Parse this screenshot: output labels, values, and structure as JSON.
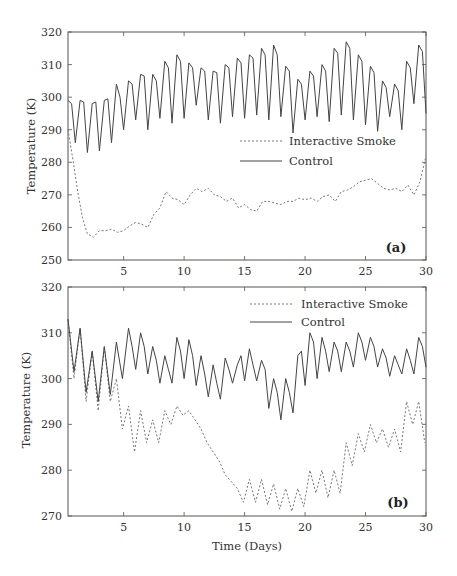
{
  "chart_data": [
    {
      "type": "line",
      "panel_label": "(a)",
      "title": "",
      "xlabel": "",
      "ylabel": "Temperature (K)",
      "xlim": [
        0.4,
        30
      ],
      "ylim": [
        250,
        320
      ],
      "x_ticks": [
        5,
        10,
        15,
        20,
        25,
        30
      ],
      "y_ticks": [
        250,
        260,
        270,
        280,
        290,
        300,
        310,
        320
      ],
      "grid": false,
      "legend": {
        "position": "center-right",
        "entries": [
          "Interactive Smoke",
          "Control"
        ]
      },
      "series": [
        {
          "name": "Interactive Smoke",
          "style": "dashed",
          "x": [
            0.4,
            0.8,
            1.2,
            1.6,
            2.0,
            2.5,
            3.0,
            3.5,
            4.0,
            4.5,
            5.0,
            5.5,
            6.0,
            6.5,
            7.0,
            7.5,
            8.0,
            8.5,
            9.0,
            9.5,
            10.0,
            10.5,
            11.0,
            11.5,
            12.0,
            12.5,
            13.0,
            13.5,
            14.0,
            14.5,
            15.0,
            15.5,
            16.0,
            16.5,
            17.0,
            17.5,
            18.0,
            18.5,
            19.0,
            19.5,
            20.0,
            20.5,
            21.0,
            21.5,
            22.0,
            22.5,
            23.0,
            23.5,
            24.0,
            24.5,
            25.0,
            25.5,
            26.0,
            26.5,
            27.0,
            27.5,
            28.0,
            28.5,
            29.0,
            29.5,
            30.0
          ],
          "values": [
            290,
            281,
            271,
            263,
            258,
            257,
            259,
            259,
            259.5,
            258.5,
            259,
            260.5,
            261.5,
            261,
            260,
            264,
            266,
            271,
            269,
            268.5,
            267,
            270,
            272,
            271,
            272,
            270,
            269.5,
            268,
            269,
            266,
            267,
            265.5,
            265,
            268,
            268,
            267.5,
            267,
            268,
            268,
            269,
            268.5,
            269,
            268,
            269.5,
            270,
            268,
            271,
            271.5,
            272.5,
            274,
            274.5,
            275,
            273.5,
            272,
            271.5,
            272,
            271,
            273,
            270,
            274,
            282
          ]
        },
        {
          "name": "Control",
          "style": "solid",
          "x": [
            0.4,
            0.7,
            1.0,
            1.4,
            1.7,
            2.0,
            2.4,
            2.7,
            3.0,
            3.4,
            3.7,
            4.0,
            4.4,
            4.7,
            5.0,
            5.4,
            5.7,
            6.0,
            6.4,
            6.7,
            7.0,
            7.4,
            7.7,
            8.0,
            8.4,
            8.7,
            9.0,
            9.4,
            9.7,
            10.0,
            10.4,
            10.7,
            11.0,
            11.4,
            11.7,
            12.0,
            12.4,
            12.7,
            13.0,
            13.4,
            13.7,
            14.0,
            14.4,
            14.7,
            15.0,
            15.4,
            15.7,
            16.0,
            16.4,
            16.7,
            17.0,
            17.4,
            17.7,
            18.0,
            18.4,
            18.7,
            19.0,
            19.4,
            19.7,
            20.0,
            20.4,
            20.7,
            21.0,
            21.4,
            21.7,
            22.0,
            22.4,
            22.7,
            23.0,
            23.4,
            23.7,
            24.0,
            24.4,
            24.7,
            25.0,
            25.4,
            25.7,
            26.0,
            26.4,
            26.7,
            27.0,
            27.4,
            27.7,
            28.0,
            28.4,
            28.7,
            29.0,
            29.4,
            29.7,
            30.0
          ],
          "values": [
            299,
            298,
            286,
            299,
            298.5,
            283,
            298,
            298.5,
            283.5,
            299,
            299.5,
            286,
            304,
            300,
            290,
            305,
            304,
            293,
            307,
            306.5,
            290,
            307,
            305,
            293.5,
            311,
            309,
            292,
            313,
            311,
            293.5,
            310.5,
            309,
            297.5,
            309,
            308,
            293,
            308,
            307.5,
            292,
            310,
            309,
            294,
            312,
            310.5,
            293.5,
            313,
            312,
            294.5,
            315,
            313,
            293,
            316,
            313,
            294,
            309.5,
            308,
            289,
            305.5,
            304,
            293,
            308,
            306.5,
            294,
            310,
            308,
            292.5,
            315,
            313.5,
            294.5,
            317,
            315,
            293,
            313,
            311,
            291.5,
            309.5,
            307.5,
            289.5,
            305,
            303,
            294,
            304,
            302,
            290,
            311,
            309,
            298,
            316,
            314,
            295,
            318,
            316,
            300
          ]
        }
      ]
    },
    {
      "type": "line",
      "panel_label": "(b)",
      "title": "",
      "xlabel": "Time (Days)",
      "ylabel": "Temperature (K)",
      "xlim": [
        0.4,
        30
      ],
      "ylim": [
        270,
        320
      ],
      "x_ticks": [
        5,
        10,
        15,
        20,
        25,
        30
      ],
      "y_ticks": [
        270,
        280,
        290,
        300,
        310,
        320
      ],
      "grid": false,
      "legend": {
        "position": "upper-right",
        "entries": [
          "Interactive Smoke",
          "Control"
        ]
      },
      "series": [
        {
          "name": "Interactive Smoke",
          "style": "dashed",
          "x": [
            0.4,
            0.9,
            1.4,
            1.9,
            2.4,
            2.9,
            3.4,
            3.9,
            4.4,
            4.9,
            5.4,
            5.9,
            6.4,
            6.9,
            7.4,
            7.9,
            8.4,
            8.9,
            9.4,
            9.9,
            10.4,
            10.9,
            11.4,
            11.9,
            12.4,
            12.9,
            13.4,
            13.9,
            14.4,
            14.9,
            15.4,
            15.9,
            16.4,
            16.9,
            17.4,
            17.9,
            18.4,
            18.9,
            19.4,
            19.9,
            20.4,
            20.9,
            21.4,
            21.9,
            22.4,
            22.9,
            23.4,
            23.9,
            24.4,
            24.9,
            25.4,
            25.9,
            26.4,
            26.9,
            27.4,
            27.9,
            28.4,
            28.9,
            29.4,
            29.9
          ],
          "values": [
            313,
            300,
            311,
            295,
            306,
            293,
            307,
            295,
            300,
            289,
            294,
            284,
            293,
            286,
            291,
            286,
            293,
            290,
            294,
            292,
            293,
            291,
            289,
            286,
            284,
            282,
            279,
            277.5,
            276,
            273,
            278,
            273,
            278,
            272.5,
            277,
            271.5,
            276,
            271,
            276,
            272,
            280,
            275,
            280,
            274,
            280,
            275,
            286,
            281,
            288,
            284,
            290,
            286,
            289,
            285,
            289,
            284,
            295,
            290,
            295,
            286
          ]
        },
        {
          "name": "Control",
          "style": "solid",
          "x": [
            0.4,
            0.9,
            1.4,
            1.9,
            2.4,
            2.9,
            3.4,
            3.9,
            4.4,
            4.9,
            5.4,
            5.7,
            6.0,
            6.4,
            6.7,
            7.0,
            7.4,
            7.7,
            8.0,
            8.4,
            8.7,
            9.0,
            9.4,
            9.7,
            10.0,
            10.4,
            10.7,
            11.0,
            11.4,
            11.7,
            12.0,
            12.4,
            12.7,
            13.0,
            13.4,
            13.7,
            14.0,
            14.4,
            14.7,
            15.0,
            15.4,
            15.7,
            16.0,
            16.4,
            16.7,
            17.0,
            17.4,
            17.7,
            18.0,
            18.4,
            18.7,
            19.0,
            19.4,
            19.7,
            20.0,
            20.4,
            20.7,
            21.0,
            21.4,
            21.7,
            22.0,
            22.4,
            22.7,
            23.0,
            23.4,
            23.7,
            24.0,
            24.4,
            24.7,
            25.0,
            25.4,
            25.7,
            26.0,
            26.4,
            26.7,
            27.0,
            27.4,
            27.7,
            28.0,
            28.4,
            28.7,
            29.0,
            29.4,
            29.7,
            30.0
          ],
          "values": [
            313,
            301.5,
            311,
            297,
            306,
            295,
            307,
            296.5,
            308,
            300,
            311,
            307,
            302,
            310,
            307,
            301,
            307,
            304,
            299,
            305,
            302,
            299,
            309,
            306,
            300,
            308.5,
            305,
            298.5,
            305,
            301,
            296,
            303,
            299,
            295.5,
            304.5,
            302,
            299,
            303,
            305,
            299.5,
            306.5,
            303,
            299.5,
            304,
            302,
            293.5,
            300,
            297,
            291,
            300,
            297,
            292.5,
            305,
            306,
            298.5,
            310,
            308,
            300,
            309,
            306,
            301.5,
            308,
            306,
            301.5,
            308,
            306,
            302.5,
            310,
            308,
            304,
            309,
            307,
            302.5,
            306.5,
            304.5,
            300.5,
            305,
            303,
            301,
            306.5,
            304,
            301,
            309,
            307,
            302.5
          ]
        }
      ]
    }
  ],
  "panels": [
    {
      "label": "(a)",
      "ylabel": "Temperature (K)",
      "y_tick_labels": [
        "250",
        "260",
        "270",
        "280",
        "290",
        "300",
        "310",
        "320"
      ],
      "x_tick_labels": [
        "5",
        "10",
        "15",
        "20",
        "25",
        "30"
      ],
      "legend": [
        "Interactive Smoke",
        "Control"
      ]
    },
    {
      "label": "(b)",
      "ylabel": "Temperature (K)",
      "y_tick_labels": [
        "270",
        "280",
        "290",
        "300",
        "310",
        "320"
      ],
      "x_tick_labels": [
        "5",
        "10",
        "15",
        "20",
        "25",
        "30"
      ],
      "legend": [
        "Interactive Smoke",
        "Control"
      ]
    }
  ],
  "xlabel": "Time (Days)",
  "colors": {
    "line": "#444444",
    "dashed": "#777777",
    "axis": "#555555",
    "text": "#333333"
  }
}
